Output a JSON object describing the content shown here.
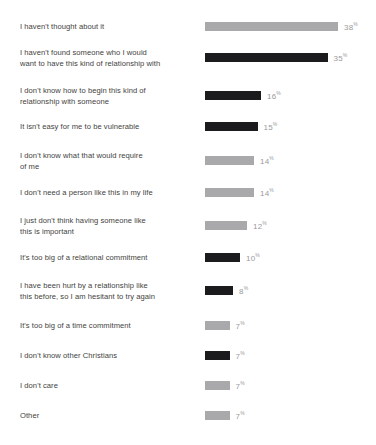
{
  "chart_data": {
    "type": "bar",
    "orientation": "horizontal",
    "title": "",
    "xlabel": "",
    "ylabel": "",
    "xlim": [
      0,
      40
    ],
    "grid": false,
    "legend": "none",
    "value_suffix": "%",
    "categories": [
      "I haven't thought about it",
      "I haven't found someone who I would\nwant to have this kind of relationship with",
      "I don't know how to begin this kind of\nrelationship with someone",
      "It isn't easy for me to be vulnerable",
      "I don't know what that would require\nof me",
      "I don't need a person like this in my life",
      "I just don't think having someone like\nthis is important",
      "It's too big of a relational commitment",
      "I have been hurt by a relationship like\nthis before, so I am hesitant to try again",
      "It's too big of a time commitment",
      "I don't know other Christians",
      "I don't care",
      "Other"
    ],
    "values": [
      38,
      35,
      16,
      15,
      14,
      14,
      12,
      10,
      8,
      7,
      7,
      7,
      7
    ],
    "value_labels": [
      "38",
      "35",
      "16",
      "15",
      "14",
      "14",
      "12",
      "10",
      "8",
      "7",
      "7",
      "7",
      "7"
    ],
    "bar_colors": [
      "#a9a9ac",
      "#1b1b1d",
      "#1b1b1d",
      "#1b1b1d",
      "#a9a9ac",
      "#a9a9ac",
      "#a9a9ac",
      "#1b1b1d",
      "#1b1b1d",
      "#a9a9ac",
      "#1b1b1d",
      "#a9a9ac",
      "#a9a9ac"
    ],
    "colors": {
      "light_bar": "#a9a9ac",
      "dark_bar": "#1b1b1d",
      "label_text": "#3f3f41",
      "value_text": "#9a9a9c",
      "background": "#ffffff"
    }
  },
  "footnote": ""
}
